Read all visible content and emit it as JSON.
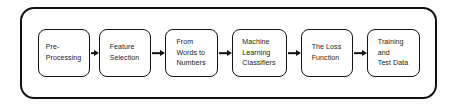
{
  "diagram": {
    "type": "flowchart",
    "orientation": "left-to-right",
    "container": {
      "shape": "rounded-rectangle",
      "border_color": "#111111",
      "fill_color": "#ffffff"
    },
    "node_style": {
      "shape": "rounded-rectangle",
      "border_color": "#141414",
      "fill_color": "#ffffff",
      "text_color": "#1b1b1b"
    },
    "connector_style": {
      "type": "arrow",
      "color": "#141414"
    },
    "nodes": [
      {
        "id": "pre-processing",
        "label": "Pre-\nProcessing"
      },
      {
        "id": "feature-selection",
        "label": "Feature\nSelection"
      },
      {
        "id": "from-words-to-numbers",
        "label": "From\nWords to\nNumbers"
      },
      {
        "id": "machine-learning-classifiers",
        "label": "Machine\nLearning\nClassifiers"
      },
      {
        "id": "the-loss-function",
        "label": "The Loss\nFunction"
      },
      {
        "id": "training-and-test-data",
        "label": "Training\nand\nTest Data"
      }
    ],
    "connectors": [
      {
        "from": "pre-processing",
        "to": "feature-selection"
      },
      {
        "from": "feature-selection",
        "to": "from-words-to-numbers"
      },
      {
        "from": "from-words-to-numbers",
        "to": "machine-learning-classifiers"
      },
      {
        "from": "machine-learning-classifiers",
        "to": "the-loss-function"
      },
      {
        "from": "the-loss-function",
        "to": "training-and-test-data"
      }
    ]
  }
}
